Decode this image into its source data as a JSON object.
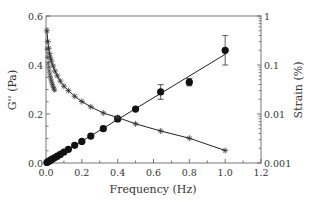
{
  "chart_data": {
    "type": "scatter",
    "title": "",
    "xlabel": "Frequency (Hz)",
    "ylabel": "G'' (Pa)",
    "y2label": "Strain (%)",
    "xlim": [
      0,
      1.2
    ],
    "ylim": [
      0,
      0.6
    ],
    "y2lim": [
      0.001,
      1
    ],
    "y2scale": "log",
    "xticks": [
      "0.0",
      "0.2",
      "0.4",
      "0.6",
      "0.8",
      "1.0",
      "1.2"
    ],
    "yticks": [
      "0.0",
      "0.2",
      "0.4",
      "0.6"
    ],
    "y2ticks": [
      "0.001",
      "0.01",
      "0.1",
      "1"
    ],
    "grid": false,
    "series": [
      {
        "name": "G''",
        "marker": "filled-circle",
        "axis": "left",
        "x": [
          0.005,
          0.01,
          0.015,
          0.02,
          0.025,
          0.03,
          0.04,
          0.05,
          0.063,
          0.08,
          0.1,
          0.125,
          0.16,
          0.2,
          0.25,
          0.32,
          0.4,
          0.5,
          0.64,
          0.8,
          1.0
        ],
        "values": [
          0.002,
          0.005,
          0.007,
          0.009,
          0.011,
          0.014,
          0.018,
          0.022,
          0.028,
          0.035,
          0.045,
          0.056,
          0.072,
          0.088,
          0.11,
          0.14,
          0.18,
          0.22,
          0.29,
          0.33,
          0.46
        ],
        "errors": [
          0,
          0,
          0,
          0,
          0,
          0,
          0,
          0,
          0,
          0,
          0,
          0,
          0,
          0,
          0,
          0,
          0,
          0,
          0.03,
          0.015,
          0.06
        ],
        "fit": "linear"
      },
      {
        "name": "Strain",
        "marker": "asterisk",
        "axis": "right",
        "x": [
          0.005,
          0.01,
          0.015,
          0.02,
          0.025,
          0.03,
          0.04,
          0.05,
          0.063,
          0.08,
          0.1,
          0.125,
          0.16,
          0.2,
          0.25,
          0.32,
          0.4,
          0.5,
          0.64,
          0.8,
          1.0
        ],
        "values": [
          0.5,
          0.3,
          0.22,
          0.17,
          0.14,
          0.12,
          0.095,
          0.075,
          0.06,
          0.047,
          0.037,
          0.03,
          0.023,
          0.018,
          0.014,
          0.0105,
          0.0085,
          0.0063,
          0.0045,
          0.0032,
          0.0018
        ]
      }
    ]
  }
}
